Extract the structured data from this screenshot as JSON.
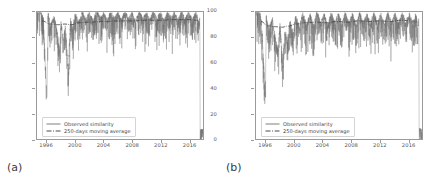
{
  "figure": {
    "background": "#ffffff",
    "series_color": "#6f6f6f",
    "average_color": "#4a4a4a",
    "axis_color": "#9a9a9a",
    "tick_color": "#555555"
  },
  "panels": [
    {
      "tag": "(a)",
      "legend": {
        "observed_label": "Observed similarity",
        "average_label": "250-days moving average"
      }
    },
    {
      "tag": "(b)",
      "legend": {
        "observed_label": "Observed similarity",
        "average_label": "250-days moving average"
      }
    }
  ],
  "chart_data": [
    {
      "type": "line",
      "panel": "(a)",
      "title": "",
      "xlabel": "",
      "ylabel": "",
      "xlim": [
        1994.6,
        2018.0
      ],
      "ylim": [
        0,
        100
      ],
      "grid": false,
      "legend_position": "lower left",
      "xticks": [
        1996,
        2000,
        2004,
        2008,
        2012,
        2016
      ],
      "yticks": [
        0,
        20,
        40,
        60,
        80,
        100
      ],
      "series": [
        {
          "name": "Observed similarity",
          "style": "solid",
          "description": "Dense daily series; bulk of values between 85 and 100 with frequent downward spikes to 75-85, several deep spikes to 25-65 clustered 1996-2000, and a terminal drop to 0 at the right edge.",
          "x": [
            1995.0,
            1995.5,
            1996.0,
            1996.15,
            1996.5,
            1997.0,
            1997.4,
            1997.8,
            1998.0,
            1998.3,
            1998.6,
            1999.0,
            1999.3,
            1999.6,
            2000.0,
            2000.5,
            2001.0,
            2001.5,
            2002.0,
            2002.5,
            2003.0,
            2003.5,
            2004.0,
            2004.5,
            2005.0,
            2005.5,
            2006.0,
            2006.5,
            2007.0,
            2007.5,
            2008.0,
            2008.5,
            2009.0,
            2009.5,
            2010.0,
            2010.5,
            2011.0,
            2011.5,
            2012.0,
            2012.5,
            2013.0,
            2013.5,
            2014.0,
            2014.5,
            2015.0,
            2015.5,
            2016.0,
            2016.5,
            2017.0,
            2017.4,
            2017.55,
            2017.6
          ],
          "y": [
            96,
            88,
            26,
            93,
            83,
            90,
            79,
            64,
            86,
            71,
            83,
            46,
            88,
            80,
            92,
            85,
            94,
            87,
            93,
            86,
            95,
            88,
            93,
            86,
            94,
            88,
            93,
            87,
            94,
            88,
            93,
            86,
            94,
            88,
            93,
            87,
            94,
            88,
            93,
            86,
            94,
            88,
            93,
            87,
            94,
            88,
            93,
            87,
            93,
            86,
            92,
            0
          ]
        },
        {
          "name": "250-days moving average",
          "style": "dashdot",
          "description": "Smooth trend riding near the top of the band, slowly rising from about 90 to about 94.",
          "x": [
            1995.3,
            1996.5,
            1997.5,
            1998.5,
            1999.5,
            2000.5,
            2002.0,
            2004.0,
            2006.0,
            2008.0,
            2010.0,
            2012.0,
            2014.0,
            2016.0,
            2017.3
          ],
          "y": [
            93,
            90.5,
            90,
            90.5,
            90,
            91.5,
            92,
            92.5,
            93,
            93,
            93.5,
            93.5,
            94,
            94,
            93.5
          ]
        }
      ]
    },
    {
      "type": "line",
      "panel": "(b)",
      "title": "",
      "xlabel": "",
      "ylabel": "",
      "xlim": [
        1994.6,
        2018.0
      ],
      "ylim": [
        0,
        100
      ],
      "grid": false,
      "legend_position": "lower left",
      "xticks": [
        1996,
        2000,
        2004,
        2008,
        2012,
        2016
      ],
      "yticks": [
        0,
        20,
        40,
        60,
        80,
        100
      ],
      "series": [
        {
          "name": "Observed similarity",
          "style": "solid",
          "description": "Dense daily series; main band 82-100 with many downward spikes into the 65-80 range, deep excursions to 25-55 around 1996-1999, and a terminal drop to 0 at the right edge.",
          "x": [
            1995.0,
            1995.4,
            1995.9,
            1996.05,
            1996.4,
            1996.9,
            1997.3,
            1997.7,
            1998.0,
            1998.35,
            1998.7,
            1999.0,
            1999.4,
            1999.8,
            2000.2,
            2000.7,
            2001.2,
            2001.7,
            2002.2,
            2002.7,
            2003.2,
            2003.7,
            2004.2,
            2004.7,
            2005.2,
            2005.7,
            2006.2,
            2006.7,
            2007.2,
            2007.7,
            2008.2,
            2008.7,
            2009.2,
            2009.7,
            2010.2,
            2010.7,
            2011.2,
            2011.7,
            2012.2,
            2012.7,
            2013.2,
            2013.7,
            2014.2,
            2014.7,
            2015.2,
            2015.7,
            2016.2,
            2016.7,
            2017.1,
            2017.4,
            2017.55,
            2017.6
          ],
          "y": [
            95,
            84,
            25,
            90,
            78,
            88,
            73,
            62,
            84,
            53,
            80,
            68,
            86,
            75,
            90,
            80,
            92,
            82,
            91,
            81,
            93,
            83,
            91,
            82,
            92,
            84,
            91,
            83,
            92,
            84,
            91,
            82,
            92,
            84,
            91,
            83,
            92,
            84,
            91,
            82,
            92,
            84,
            91,
            83,
            92,
            84,
            91,
            83,
            91,
            82,
            90,
            0
          ]
        },
        {
          "name": "250-days moving average",
          "style": "dashdot",
          "description": "Smooth trend through the upper part of the band, undulating between about 88 and 94.",
          "x": [
            1995.3,
            1996.3,
            1997.2,
            1998.2,
            1999.2,
            2000.2,
            2001.5,
            2003.0,
            2004.5,
            2006.0,
            2007.5,
            2009.0,
            2010.5,
            2012.0,
            2013.5,
            2015.0,
            2016.5,
            2017.3
          ],
          "y": [
            92.5,
            89,
            88.5,
            88,
            89,
            90.5,
            91.5,
            92,
            91.5,
            92.5,
            92,
            93,
            92.5,
            93,
            92.5,
            93.5,
            93,
            92.5
          ]
        }
      ]
    }
  ]
}
